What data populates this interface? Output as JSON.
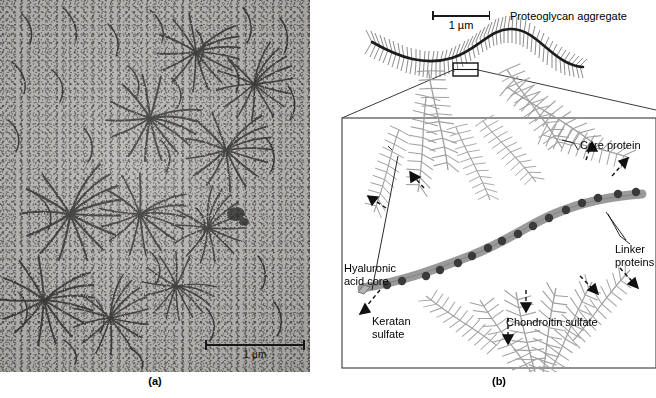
{
  "figure": {
    "panels": [
      {
        "id": "a",
        "label": "(a)",
        "type": "electron-micrograph",
        "scale_bar": {
          "label": "1 µm",
          "length_px": 100
        }
      },
      {
        "id": "b",
        "label": "(b)",
        "type": "schematic-diagram",
        "scale_bar": {
          "label": "1 µm",
          "length_px": 58
        }
      }
    ]
  },
  "diagram": {
    "overview_title": "Proteoglycan aggregate",
    "scale_label": "1 µm",
    "callouts": {
      "core_protein": "Core protein",
      "linker_proteins_line1": "Linker",
      "linker_proteins_line2": "proteins",
      "hyaluronic_line1": "Hyaluronic",
      "hyaluronic_line2": "acid core",
      "keratan_line1": "Keratan",
      "keratan_line2": "sulfate",
      "chondroitin": "Chondroitin sulfate"
    }
  },
  "micrograph": {
    "scale_label": "1 µm"
  },
  "colors": {
    "hyaluronic_core": "#9a9a9a",
    "linker_dot": "#3a3a3a",
    "core_protein_line": "#808080",
    "aggregate_backbone": "#1c1c1c",
    "panel_border": "#4a4a4a",
    "micrograph_base": "#b9b7b3"
  }
}
